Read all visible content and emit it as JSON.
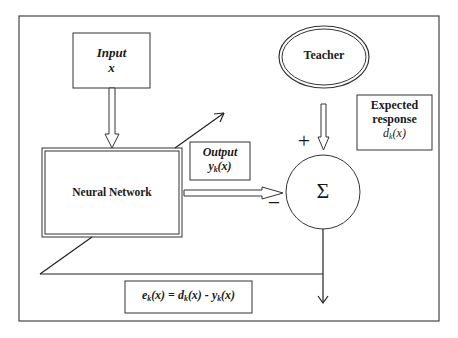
{
  "diagram": {
    "type": "supervised-learning-block-diagram",
    "nodes": {
      "input": {
        "line1": "Input",
        "line2": "x"
      },
      "teacher": {
        "label": "Teacher"
      },
      "neural_network": {
        "label": "Neural Network"
      },
      "output": {
        "line1": "Output",
        "line2_base": "y",
        "line2_sub": "k",
        "line2_tail": "(x)"
      },
      "expected": {
        "line1": "Expected",
        "line2": "response",
        "line3_base": "d",
        "line3_sub": "k",
        "line3_tail": "(x)"
      },
      "summation": {
        "symbol": "Σ",
        "plus": "+",
        "minus": "−"
      },
      "error": {
        "e": "e",
        "e_sub": "k",
        "e_tail": "(x) = ",
        "d": "d",
        "d_sub": "k",
        "d_tail": "(x) - ",
        "y": "y",
        "y_sub": "k",
        "y_tail": "(x)"
      }
    },
    "edges": [
      {
        "from": "input",
        "to": "neural_network",
        "style": "hollow-arrow"
      },
      {
        "from": "teacher",
        "to": "summation",
        "style": "hollow-arrow",
        "sign": "+"
      },
      {
        "from": "neural_network",
        "to": "summation",
        "style": "hollow-arrow",
        "sign": "-"
      },
      {
        "from": "summation",
        "to": "error-out",
        "style": "line-arrow"
      },
      {
        "from": "error-out",
        "to": "neural_network",
        "style": "feedback-diagonal-arrow"
      }
    ],
    "colors": {
      "line": "#2a2a2a",
      "background": "#ffffff"
    }
  }
}
